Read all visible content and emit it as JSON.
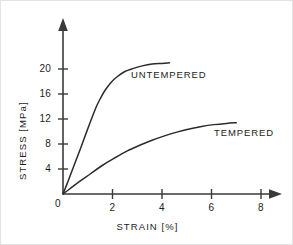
{
  "chart_data": {
    "type": "line",
    "title": "",
    "xlabel": "STRAIN [%]",
    "ylabel": "STRESS [MPa]",
    "xlim": [
      0,
      8.6
    ],
    "ylim": [
      0,
      23.5
    ],
    "xticks": [
      0,
      2,
      4,
      6,
      8
    ],
    "xtick_labels": [
      "0",
      "2",
      "4",
      "6",
      "8"
    ],
    "yticks": [
      4,
      8,
      12,
      16,
      20
    ],
    "ytick_labels": [
      "4",
      "8",
      "12",
      "16",
      "20"
    ],
    "grid": false,
    "legend_position": "inline-annotations",
    "origin_label": "0",
    "series": [
      {
        "name": "UNTEMPERED",
        "label_x": 2.75,
        "label_y": 19.0,
        "x": [
          0,
          0.2,
          0.45,
          0.7,
          0.95,
          1.15,
          1.35,
          1.5,
          1.7,
          1.95,
          2.2,
          2.5,
          2.85,
          3.2,
          3.6,
          4.0,
          4.3
        ],
        "y": [
          0,
          2.0,
          4.6,
          7.2,
          9.9,
          12.0,
          14.0,
          15.2,
          16.6,
          17.9,
          18.8,
          19.6,
          20.1,
          20.5,
          20.8,
          20.9,
          21.0
        ]
      },
      {
        "name": "TEMPERED",
        "label_x": 6.1,
        "label_y": 9.8,
        "x": [
          0,
          0.3,
          0.7,
          1.1,
          1.6,
          2.1,
          2.6,
          3.1,
          3.6,
          4.1,
          4.6,
          5.1,
          5.6,
          6.1,
          6.6,
          7.0
        ],
        "y": [
          0,
          0.9,
          2.1,
          3.2,
          4.6,
          5.8,
          6.9,
          7.8,
          8.6,
          9.3,
          9.9,
          10.4,
          10.8,
          11.1,
          11.3,
          11.4
        ]
      }
    ]
  }
}
